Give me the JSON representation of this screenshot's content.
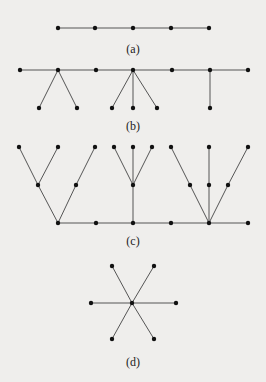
{
  "figure": {
    "background": "#efeeec",
    "node_color": "#111111",
    "edge_color": "#555555",
    "panels": [
      {
        "id": "a",
        "label": "(a)",
        "label_pos": [
          133,
          53
        ],
        "description": "path graph with 5 vertices",
        "nodes": [
          [
            58,
            28
          ],
          [
            95,
            28
          ],
          [
            133,
            28
          ],
          [
            171,
            28
          ],
          [
            209,
            28
          ]
        ],
        "edges": [
          [
            0,
            1
          ],
          [
            1,
            2
          ],
          [
            2,
            3
          ],
          [
            3,
            4
          ]
        ]
      },
      {
        "id": "b",
        "label": "(b)",
        "label_pos": [
          133,
          130
        ],
        "description": "caterpillar tree: spine of 7 vertices with pendant leaves",
        "nodes": [
          [
            20,
            70
          ],
          [
            58,
            70
          ],
          [
            96,
            70
          ],
          [
            133,
            70
          ],
          [
            172,
            70
          ],
          [
            210,
            70
          ],
          [
            248,
            70
          ],
          [
            39,
            108
          ],
          [
            77,
            108
          ],
          [
            112,
            108
          ],
          [
            133,
            108
          ],
          [
            157,
            108
          ],
          [
            210,
            108
          ]
        ],
        "edges": [
          [
            0,
            1
          ],
          [
            1,
            2
          ],
          [
            2,
            3
          ],
          [
            3,
            4
          ],
          [
            4,
            5
          ],
          [
            5,
            6
          ],
          [
            1,
            7
          ],
          [
            1,
            8
          ],
          [
            3,
            9
          ],
          [
            3,
            10
          ],
          [
            3,
            11
          ],
          [
            5,
            12
          ]
        ]
      },
      {
        "id": "c",
        "label": "(c)",
        "label_pos": [
          133,
          245
        ],
        "description": "tree with spine of 6 vertices and branching subtrees",
        "nodes": [
          [
            58,
            223
          ],
          [
            96,
            223
          ],
          [
            133,
            223
          ],
          [
            171,
            223
          ],
          [
            209,
            223
          ],
          [
            248,
            223
          ],
          [
            38,
            185
          ],
          [
            76,
            185
          ],
          [
            19,
            147
          ],
          [
            58,
            147
          ],
          [
            95,
            147
          ],
          [
            133,
            185
          ],
          [
            114,
            147
          ],
          [
            133,
            147
          ],
          [
            152,
            147
          ],
          [
            190,
            185
          ],
          [
            209,
            185
          ],
          [
            228,
            185
          ],
          [
            171,
            147
          ],
          [
            209,
            147
          ],
          [
            248,
            147
          ]
        ],
        "edges": [
          [
            0,
            1
          ],
          [
            1,
            2
          ],
          [
            2,
            3
          ],
          [
            3,
            4
          ],
          [
            4,
            5
          ],
          [
            0,
            6
          ],
          [
            0,
            7
          ],
          [
            6,
            8
          ],
          [
            6,
            9
          ],
          [
            7,
            10
          ],
          [
            2,
            11
          ],
          [
            11,
            12
          ],
          [
            11,
            13
          ],
          [
            11,
            14
          ],
          [
            4,
            15
          ],
          [
            4,
            16
          ],
          [
            4,
            17
          ],
          [
            15,
            18
          ],
          [
            16,
            19
          ],
          [
            17,
            20
          ]
        ]
      },
      {
        "id": "d",
        "label": "(d)",
        "label_pos": [
          133,
          366
        ],
        "description": "star graph K1,6",
        "nodes": [
          [
            132,
            303
          ],
          [
            112,
            266
          ],
          [
            154,
            266
          ],
          [
            91,
            303
          ],
          [
            176,
            303
          ],
          [
            112,
            339
          ],
          [
            154,
            339
          ]
        ],
        "edges": [
          [
            0,
            1
          ],
          [
            0,
            2
          ],
          [
            0,
            3
          ],
          [
            0,
            4
          ],
          [
            0,
            5
          ],
          [
            0,
            6
          ]
        ]
      }
    ]
  }
}
